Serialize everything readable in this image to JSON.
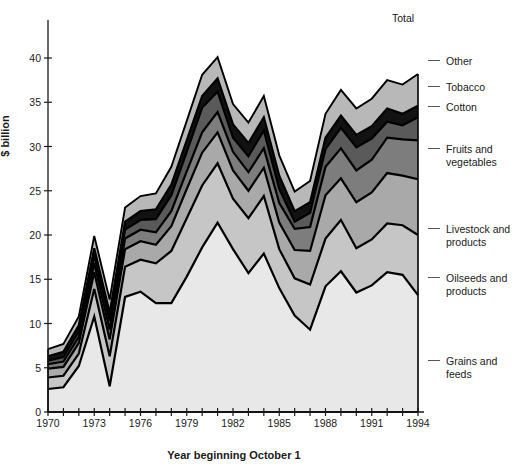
{
  "chart_data": {
    "type": "area",
    "title": "",
    "xlabel": "Year beginning October 1",
    "ylabel": "$ billion",
    "x": [
      1970,
      1971,
      1972,
      1973,
      1974,
      1975,
      1976,
      1977,
      1978,
      1979,
      1980,
      1981,
      1982,
      1983,
      1984,
      1985,
      1986,
      1987,
      1988,
      1989,
      1990,
      1991,
      1992,
      1993,
      1994
    ],
    "xlim": [
      1970,
      1994
    ],
    "ylim": [
      0,
      44
    ],
    "xticks": [
      1970,
      1971,
      1972,
      1973,
      1974,
      1975,
      1976,
      1977,
      1978,
      1979,
      1980,
      1981,
      1982,
      1983,
      1984,
      1985,
      1986,
      1987,
      1988,
      1989,
      1990,
      1991,
      1992,
      1993,
      1994
    ],
    "xticklabels": [
      "1970",
      "",
      "",
      "1973",
      "",
      "",
      "1976",
      "",
      "",
      "1979",
      "",
      "",
      "1982",
      "",
      "",
      "1985",
      "",
      "",
      "1988",
      "",
      "",
      "1991",
      "",
      "",
      "1994"
    ],
    "yticks": [
      0,
      5,
      10,
      15,
      20,
      25,
      30,
      35,
      40
    ],
    "yticklabels": [
      "0",
      "5",
      "10",
      "15",
      "20",
      "25",
      "30",
      "35",
      "40"
    ],
    "grid": false,
    "legend_position": "right-outside",
    "stacked": true,
    "series": [
      {
        "name": "Grains and feeds",
        "color": "#e8e8e8",
        "values": [
          2.6,
          2.8,
          5.2,
          10.8,
          2.9,
          13.0,
          13.6,
          12.3,
          12.3,
          15.3,
          18.6,
          21.4,
          18.4,
          15.7,
          17.9,
          14.0,
          10.9,
          9.3,
          14.2,
          15.9,
          13.5,
          14.3,
          15.8,
          15.5,
          13.2
        ]
      },
      {
        "name": "Oilseeds and products",
        "color": "#c6c6c6",
        "values": [
          1.3,
          1.3,
          1.4,
          3.1,
          3.4,
          3.4,
          3.6,
          4.5,
          5.9,
          6.6,
          7.0,
          6.7,
          5.7,
          6.2,
          6.5,
          4.4,
          4.2,
          5.1,
          5.4,
          5.8,
          5.0,
          5.2,
          5.5,
          5.6,
          6.8
        ]
      },
      {
        "name": "Livestock and products",
        "color": "#a9a9a9",
        "values": [
          1.0,
          1.0,
          1.2,
          1.9,
          1.9,
          2.0,
          2.1,
          2.1,
          2.8,
          3.3,
          3.7,
          3.5,
          3.2,
          3.1,
          3.2,
          3.0,
          3.2,
          3.8,
          4.9,
          4.7,
          5.2,
          5.3,
          5.7,
          5.6,
          6.3
        ]
      },
      {
        "name": "Fruits and vegetables",
        "color": "#7d7d7d",
        "values": [
          0.5,
          0.6,
          0.7,
          1.0,
          1.1,
          1.2,
          1.3,
          1.4,
          1.7,
          2.0,
          2.3,
          2.3,
          2.1,
          2.1,
          2.2,
          2.2,
          2.4,
          2.7,
          3.2,
          3.4,
          3.6,
          3.7,
          4.0,
          4.1,
          4.4
        ]
      },
      {
        "name": "Cotton",
        "color": "#5a5a5a",
        "values": [
          0.4,
          0.5,
          0.6,
          0.9,
          1.0,
          1.0,
          1.1,
          1.5,
          1.8,
          2.2,
          2.8,
          2.3,
          1.6,
          1.8,
          2.0,
          1.6,
          0.8,
          1.6,
          2.0,
          2.3,
          2.6,
          2.4,
          1.8,
          1.6,
          2.6
        ]
      },
      {
        "name": "Tobacco",
        "color": "#121212",
        "values": [
          0.5,
          0.6,
          0.7,
          0.8,
          0.9,
          0.9,
          1.0,
          1.1,
          1.2,
          1.3,
          1.3,
          1.5,
          1.5,
          1.5,
          1.5,
          1.5,
          1.2,
          1.2,
          1.3,
          1.4,
          1.4,
          1.4,
          1.5,
          1.3,
          1.3
        ]
      },
      {
        "name": "Other",
        "color": "#b8b8b8",
        "values": [
          0.8,
          0.9,
          1.0,
          1.4,
          1.5,
          1.6,
          1.7,
          1.8,
          2.0,
          2.2,
          2.4,
          2.4,
          2.3,
          2.3,
          2.4,
          2.3,
          2.2,
          2.4,
          2.7,
          2.9,
          3.0,
          3.1,
          3.2,
          3.3,
          3.6
        ]
      }
    ],
    "total_label": "Total",
    "legend_entries": [
      {
        "label": "Other",
        "y": 55
      },
      {
        "label": "Tobacco",
        "y": 81
      },
      {
        "label": "Cotton",
        "y": 101
      },
      {
        "label": "Fruits and\nvegetables",
        "y": 143
      },
      {
        "label": "Livestock and\nproducts",
        "y": 223
      },
      {
        "label": "Oilseeds and\nproducts",
        "y": 272
      },
      {
        "label": "Grains and\nfeeds",
        "y": 355
      }
    ],
    "axis_color": "#1a1a1a",
    "outline_color": "#000000"
  }
}
